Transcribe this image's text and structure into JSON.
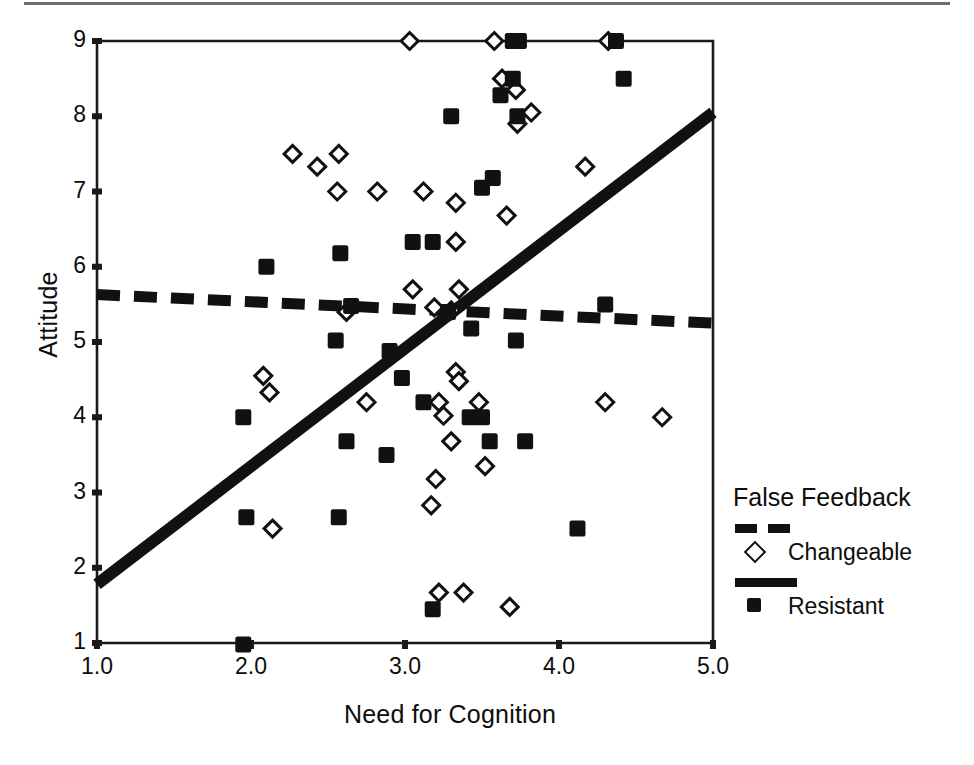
{
  "chart_data": {
    "type": "scatter",
    "title": "",
    "xlabel": "Need for Cognition",
    "ylabel": "Attitude",
    "xlim": [
      1.0,
      5.0
    ],
    "ylim": [
      1,
      9
    ],
    "xticks": [
      "1.0",
      "2.0",
      "3.0",
      "4.0",
      "5.0"
    ],
    "xtick_values": [
      1.0,
      2.0,
      3.0,
      4.0,
      5.0
    ],
    "yticks": [
      "1",
      "2",
      "3",
      "4",
      "5",
      "6",
      "7",
      "8",
      "9"
    ],
    "ytick_values": [
      1,
      2,
      3,
      4,
      5,
      6,
      7,
      8,
      9
    ],
    "grid": false,
    "legend_position": "right",
    "legend_title": "False Feedback",
    "series": [
      {
        "name": "Changeable",
        "marker": "open-diamond",
        "line_style": "dashed",
        "color": "#111111",
        "points": [
          [
            3.03,
            9.0
          ],
          [
            3.58,
            9.0
          ],
          [
            4.32,
            9.0
          ],
          [
            3.63,
            8.5
          ],
          [
            3.72,
            8.35
          ],
          [
            3.82,
            8.05
          ],
          [
            3.73,
            7.9
          ],
          [
            2.27,
            7.5
          ],
          [
            2.57,
            7.5
          ],
          [
            2.43,
            7.33
          ],
          [
            4.17,
            7.33
          ],
          [
            2.56,
            7.0
          ],
          [
            2.82,
            7.0
          ],
          [
            3.12,
            7.0
          ],
          [
            3.33,
            6.85
          ],
          [
            3.66,
            6.68
          ],
          [
            3.33,
            6.33
          ],
          [
            3.05,
            5.7
          ],
          [
            3.35,
            5.7
          ],
          [
            2.62,
            5.4
          ],
          [
            3.19,
            5.46
          ],
          [
            3.3,
            5.42
          ],
          [
            2.08,
            4.55
          ],
          [
            2.12,
            4.33
          ],
          [
            3.33,
            4.6
          ],
          [
            3.35,
            4.48
          ],
          [
            2.75,
            4.2
          ],
          [
            3.22,
            4.2
          ],
          [
            3.48,
            4.2
          ],
          [
            4.3,
            4.2
          ],
          [
            3.25,
            4.02
          ],
          [
            4.67,
            4.0
          ],
          [
            3.3,
            3.68
          ],
          [
            3.2,
            3.18
          ],
          [
            3.52,
            3.35
          ],
          [
            3.17,
            2.83
          ],
          [
            2.14,
            2.52
          ],
          [
            3.22,
            1.67
          ],
          [
            3.38,
            1.67
          ],
          [
            3.68,
            1.48
          ]
        ],
        "fit_line": {
          "x": [
            1.0,
            5.0
          ],
          "y": [
            5.63,
            5.25
          ]
        }
      },
      {
        "name": "Resistant",
        "marker": "filled-square",
        "line_style": "solid",
        "color": "#111111",
        "points": [
          [
            3.7,
            9.0
          ],
          [
            3.74,
            9.0
          ],
          [
            4.37,
            9.0
          ],
          [
            4.42,
            8.5
          ],
          [
            3.62,
            8.28
          ],
          [
            3.7,
            8.5
          ],
          [
            3.3,
            8.0
          ],
          [
            3.73,
            8.0
          ],
          [
            3.57,
            7.18
          ],
          [
            3.5,
            7.05
          ],
          [
            2.58,
            6.18
          ],
          [
            3.05,
            6.33
          ],
          [
            2.1,
            6.0
          ],
          [
            3.18,
            6.33
          ],
          [
            2.55,
            5.02
          ],
          [
            3.43,
            5.18
          ],
          [
            3.72,
            5.02
          ],
          [
            4.3,
            5.5
          ],
          [
            3.28,
            5.4
          ],
          [
            2.65,
            5.48
          ],
          [
            2.9,
            4.88
          ],
          [
            2.98,
            4.52
          ],
          [
            3.12,
            4.2
          ],
          [
            3.42,
            4.0
          ],
          [
            3.5,
            4.0
          ],
          [
            2.62,
            3.68
          ],
          [
            3.55,
            3.68
          ],
          [
            3.78,
            3.68
          ],
          [
            2.88,
            3.5
          ],
          [
            4.12,
            2.52
          ],
          [
            1.95,
            4.0
          ],
          [
            1.97,
            2.67
          ],
          [
            2.57,
            2.67
          ],
          [
            1.95,
            0.98
          ],
          [
            3.18,
            1.45
          ]
        ],
        "fit_line": {
          "x": [
            1.0,
            5.0
          ],
          "y": [
            1.78,
            8.05
          ]
        }
      }
    ]
  },
  "figure": {
    "ylabel": "Attitude",
    "xlabel": "Need for Cognition",
    "legend": {
      "title": "False Feedback",
      "entries": [
        {
          "label": "Changeable",
          "style": "dashed",
          "marker": "diamond"
        },
        {
          "label": "Resistant",
          "style": "solid",
          "marker": "square"
        }
      ]
    }
  }
}
